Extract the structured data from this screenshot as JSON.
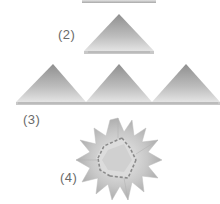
{
  "diagram": {
    "type": "origami-instructions",
    "steps": [
      {
        "id": "1",
        "label": "",
        "description": "folded strip (cropped at top)"
      },
      {
        "id": "2",
        "label": "(2)",
        "description": "single folded triangle unit"
      },
      {
        "id": "3",
        "label": "(3)",
        "description": "three triangle units placed side by side"
      },
      {
        "id": "4",
        "label": "(4)",
        "description": "assembled star / flower shape"
      }
    ],
    "colors": {
      "paper_light": "#e6e6e6",
      "paper_mid": "#c4c4c4",
      "paper_dark": "#9a9a9a",
      "edge": "#b8b8b8",
      "label": "#6a6a6a",
      "background": "#ffffff"
    }
  }
}
